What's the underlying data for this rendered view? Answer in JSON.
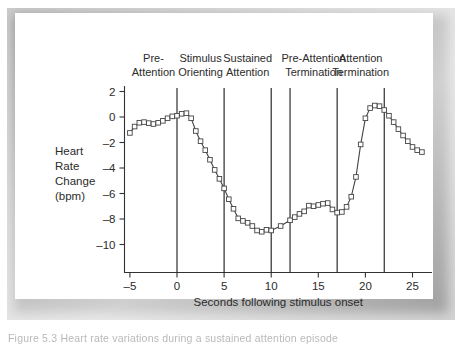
{
  "figure": {
    "caption": "Figure 5.3   Heart rate variations during a sustained attention episode"
  },
  "chart_data": {
    "type": "line",
    "title": "",
    "xlabel": "Seconds following stimulus onset",
    "ylabel": "Heart Rate Change (bpm)",
    "ylabel_lines": [
      "Heart",
      "Rate",
      "Change",
      "(bpm)"
    ],
    "xlim": [
      -5.8,
      26.5
    ],
    "ylim": [
      -10.8,
      2.6
    ],
    "xticks": [
      -5,
      0,
      5,
      10,
      15,
      20,
      25
    ],
    "xtick_labels": [
      "–5",
      "0",
      "5",
      "10",
      "15",
      "20",
      "25"
    ],
    "yticks": [
      2,
      0,
      -2,
      -4,
      -6,
      -8,
      -10
    ],
    "ytick_labels": [
      "2",
      "0",
      "–2",
      "–4",
      "–6",
      "–8",
      "–10"
    ],
    "grid": false,
    "legend": null,
    "marker": "open-square",
    "series": [
      {
        "name": "Heart rate change",
        "x": [
          -5.0,
          -4.5,
          -4.0,
          -3.5,
          -3.0,
          -2.5,
          -2.0,
          -1.5,
          -1.0,
          -0.5,
          0.0,
          0.5,
          1.0,
          1.5,
          2.0,
          2.5,
          3.0,
          3.5,
          4.0,
          4.5,
          5.0,
          5.5,
          6.0,
          6.5,
          7.0,
          7.5,
          8.0,
          8.5,
          9.0,
          9.5,
          10.0,
          11.0,
          12.0,
          12.5,
          13.0,
          13.5,
          14.0,
          14.5,
          15.0,
          15.5,
          16.0,
          16.5,
          17.0,
          17.5,
          18.0,
          18.5,
          19.0,
          19.5,
          20.0,
          20.5,
          21.0,
          21.5,
          22.0
        ],
        "y": [
          -1.25,
          -0.75,
          -0.45,
          -0.4,
          -0.48,
          -0.55,
          -0.45,
          -0.3,
          -0.1,
          0.05,
          0.1,
          0.25,
          0.3,
          -0.1,
          -1.1,
          -1.9,
          -2.6,
          -3.35,
          -4.15,
          -4.85,
          -5.6,
          -6.45,
          -7.2,
          -7.95,
          -8.15,
          -8.3,
          -8.55,
          -8.9,
          -9.0,
          -8.85,
          -8.9,
          -8.55,
          -8.1,
          -7.85,
          -7.6,
          -7.4,
          -6.95,
          -7.0,
          -6.9,
          -6.8,
          -6.75,
          -7.25,
          -7.5,
          -7.45,
          -7.05,
          -6.25,
          -4.7,
          -2.15,
          -0.1,
          0.7,
          0.9,
          0.85,
          0.55
        ]
      }
    ],
    "series_extra": {
      "note": "single continuous trace with open square markers at each sample"
    },
    "tail": {
      "x": [
        22.5,
        23.0,
        23.5,
        24.0,
        24.5,
        25.0,
        25.5,
        26.0
      ],
      "y": [
        0.1,
        -0.4,
        -0.95,
        -1.45,
        -1.9,
        -2.35,
        -2.6,
        -2.75
      ]
    },
    "phase_separators": [
      0,
      5,
      10,
      12,
      17,
      22
    ],
    "phases": [
      {
        "id": "pre-attention",
        "line1": "Pre-",
        "line2": "Attention",
        "center": -2.5
      },
      {
        "id": "stimulus-orienting",
        "line1": "Stimulus",
        "line2": "Orienting",
        "center": 2.5
      },
      {
        "id": "sustained-attention",
        "line1": "Sustained",
        "line2": "Attention",
        "center": 7.5
      },
      {
        "id": "pre-attention-termination",
        "line1": "Pre-Attention",
        "line2": "Termination",
        "center": 14.5
      },
      {
        "id": "attention-termination",
        "line1": "Attention",
        "line2": "Termination",
        "center": 19.5
      }
    ],
    "colors": {
      "line": "#444444",
      "marker_fill": "#ffffff",
      "axis": "#333333",
      "separator": "#1a1a1a",
      "text": "#2b2b2b"
    }
  }
}
